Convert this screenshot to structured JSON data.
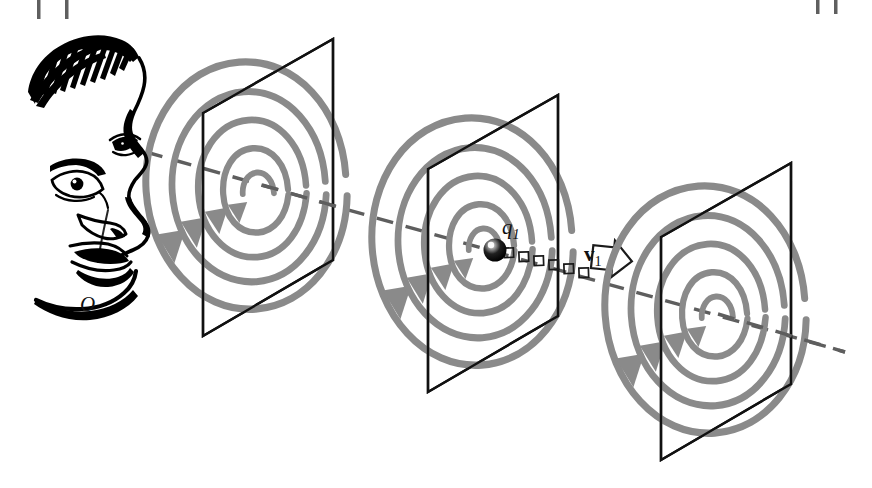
{
  "figure": {
    "type": "physics-diagram",
    "background_color": "#ffffff",
    "width": 872,
    "height": 488,
    "ink_color": "#000000",
    "spiral_color": "#8a8a8a",
    "dashed_line_color": "#5a5a5a"
  },
  "labels": {
    "observer": "O",
    "charge": "q",
    "charge_subscript": "1",
    "velocity": "v",
    "velocity_subscript": "1"
  },
  "elements": {
    "observer_face": "line-art-face-icon",
    "sight_line": "dashed-sight-line",
    "charge_marker": "black-sphere-charge",
    "velocity_arrow": "hollow-outline-arrow",
    "dotted_track": "dotted-square-trail"
  },
  "planes": [
    {
      "name": "plane-1",
      "order": 1,
      "spiral_turns": 4,
      "corners": "203,113 333,39 333,260 203,336"
    },
    {
      "name": "plane-2",
      "order": 2,
      "spiral_turns": 4,
      "corners": "428,169 558,95 558,316 428,392"
    },
    {
      "name": "plane-3",
      "order": 3,
      "spiral_turns": 4,
      "corners": "661,237 791,163 791,384 661,460"
    }
  ],
  "crop_marks": {
    "top_left": [
      "tick-1",
      "tick-2"
    ],
    "top_right": [
      "tick-3",
      "tick-4"
    ]
  }
}
